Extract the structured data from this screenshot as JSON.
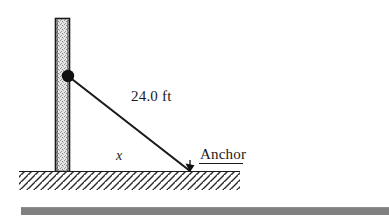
{
  "figure": {
    "labels": {
      "cable_length": "24.0 ft",
      "base_distance": "x",
      "anchor": "Anchor"
    },
    "colors": {
      "ink": "#1a1a1a",
      "pole_fill": "#d4d4d4",
      "pole_outline": "#1a1a1a",
      "ground_line": "#1a1a1a",
      "hatch": "#2b2b2b",
      "bottom_bar": "#808080",
      "background": "#ffffff"
    }
  },
  "diagram_data": {
    "type": "geometry-diagram",
    "description": "Right triangle formed by a vertical pole, a guy wire, and the ground.",
    "elements": [
      {
        "name": "pole",
        "kind": "vertical-post",
        "fill": "stippled-gray",
        "x": 55,
        "top_y": 18,
        "bottom_y": 172,
        "width": 15
      },
      {
        "name": "attachment-point",
        "kind": "filled-dot",
        "x": 68,
        "y": 76,
        "radius": 6
      },
      {
        "name": "guy-wire",
        "kind": "line-segment",
        "from": [
          68,
          76
        ],
        "to": [
          190,
          171
        ],
        "length_label": "24.0 ft"
      },
      {
        "name": "ground-line",
        "kind": "horizontal-line",
        "from": [
          19,
          172
        ],
        "to": [
          240,
          172
        ]
      },
      {
        "name": "anchor-point",
        "kind": "ground-anchor",
        "x": 190,
        "y": 172,
        "label": "Anchor"
      },
      {
        "name": "base-distance",
        "kind": "unknown-length",
        "label": "x",
        "from": [
          68,
          172
        ],
        "to": [
          190,
          172
        ]
      }
    ],
    "measurements": [
      {
        "name": "hypotenuse",
        "label": "24.0 ft",
        "value": 24.0,
        "unit": "ft",
        "known": true
      },
      {
        "name": "horizontal-leg",
        "label": "x",
        "value": null,
        "unit": "ft",
        "known": false
      }
    ]
  }
}
